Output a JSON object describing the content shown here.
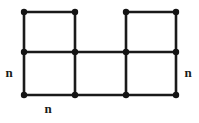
{
  "figure": {
    "background_color": "#ffffff",
    "edge_color": "#1a1a1a",
    "vertex_color": "#141414",
    "edge_width": 2.6,
    "vertex_radius": 3.2,
    "width": 199,
    "height": 123
  },
  "chart_data": {
    "type": "diagram",
    "subtype": "grid-graph",
    "title": "",
    "xlabel": "",
    "ylabel": "",
    "columns_x": [
      24,
      75,
      126,
      176
    ],
    "rows_y": [
      12,
      52,
      95
    ],
    "vertices": [
      {
        "id": "v00",
        "x": 24,
        "y": 12,
        "row": 0,
        "col": 0
      },
      {
        "id": "v01",
        "x": 75,
        "y": 12,
        "row": 0,
        "col": 1
      },
      {
        "id": "v02",
        "x": 126,
        "y": 12,
        "row": 0,
        "col": 2
      },
      {
        "id": "v03",
        "x": 176,
        "y": 12,
        "row": 0,
        "col": 3
      },
      {
        "id": "v10",
        "x": 24,
        "y": 52,
        "row": 1,
        "col": 0
      },
      {
        "id": "v11",
        "x": 75,
        "y": 52,
        "row": 1,
        "col": 1
      },
      {
        "id": "v12",
        "x": 126,
        "y": 52,
        "row": 1,
        "col": 2
      },
      {
        "id": "v13",
        "x": 176,
        "y": 52,
        "row": 1,
        "col": 3
      },
      {
        "id": "v20",
        "x": 24,
        "y": 95,
        "row": 2,
        "col": 0
      },
      {
        "id": "v21",
        "x": 75,
        "y": 95,
        "row": 2,
        "col": 1
      },
      {
        "id": "v22",
        "x": 126,
        "y": 95,
        "row": 2,
        "col": 2
      },
      {
        "id": "v23",
        "x": 176,
        "y": 95,
        "row": 2,
        "col": 3
      }
    ],
    "edges": [
      {
        "id": "e-top-left",
        "from": "v00",
        "to": "v01",
        "x1": 24,
        "y1": 12,
        "x2": 75,
        "y2": 12
      },
      {
        "id": "e-top-right",
        "from": "v02",
        "to": "v03",
        "x1": 126,
        "y1": 12,
        "x2": 176,
        "y2": 12
      },
      {
        "id": "e-middle-row",
        "from": "v10",
        "to": "v13",
        "x1": 24,
        "y1": 52,
        "x2": 176,
        "y2": 52
      },
      {
        "id": "e-bottom-row",
        "from": "v20",
        "to": "v23",
        "x1": 24,
        "y1": 95,
        "x2": 176,
        "y2": 95
      },
      {
        "id": "e-vert-c0-upper",
        "from": "v00",
        "to": "v10",
        "x1": 24,
        "y1": 12,
        "x2": 24,
        "y2": 52
      },
      {
        "id": "e-vert-c1-upper",
        "from": "v01",
        "to": "v11",
        "x1": 75,
        "y1": 12,
        "x2": 75,
        "y2": 52
      },
      {
        "id": "e-vert-c2-upper",
        "from": "v02",
        "to": "v12",
        "x1": 126,
        "y1": 12,
        "x2": 126,
        "y2": 52
      },
      {
        "id": "e-vert-c3-upper",
        "from": "v03",
        "to": "v13",
        "x1": 176,
        "y1": 12,
        "x2": 176,
        "y2": 52
      },
      {
        "id": "e-vert-c0-lower",
        "from": "v10",
        "to": "v20",
        "x1": 24,
        "y1": 52,
        "x2": 24,
        "y2": 95
      },
      {
        "id": "e-vert-c1-lower",
        "from": "v11",
        "to": "v21",
        "x1": 75,
        "y1": 52,
        "x2": 75,
        "y2": 95
      },
      {
        "id": "e-vert-c2-lower",
        "from": "v12",
        "to": "v22",
        "x1": 126,
        "y1": 52,
        "x2": 126,
        "y2": 95
      },
      {
        "id": "e-vert-c3-lower",
        "from": "v13",
        "to": "v23",
        "x1": 176,
        "y1": 52,
        "x2": 176,
        "y2": 95
      }
    ],
    "annotations": [
      {
        "id": "label-left",
        "text": "n",
        "x": 9,
        "y": 72,
        "position": "left"
      },
      {
        "id": "label-right",
        "text": "n",
        "x": 188,
        "y": 72,
        "position": "right"
      },
      {
        "id": "label-bottom",
        "text": "n",
        "x": 48,
        "y": 108,
        "position": "bottom"
      }
    ]
  },
  "labels": {
    "left": "n",
    "right": "n",
    "bottom": "n"
  }
}
